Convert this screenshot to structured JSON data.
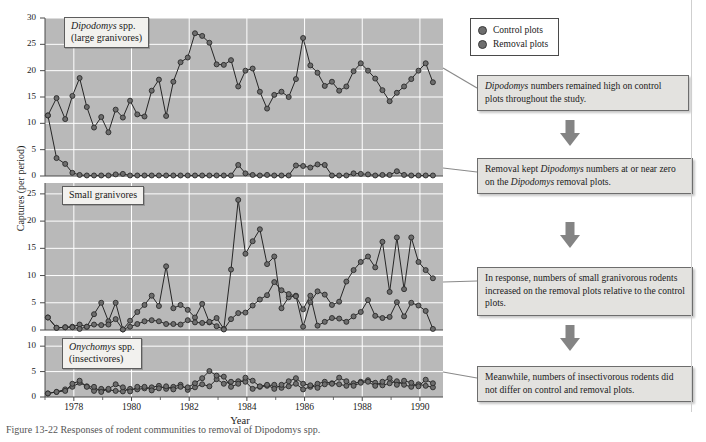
{
  "figure": {
    "caption": "Figure 13-22    Responses of rodent communities to removal of Dipodomys spp.",
    "axis_y_label": "Captures (per period)",
    "axis_x_label": "Year"
  },
  "legend": {
    "items": [
      {
        "label": "Control plots",
        "color": "#6e6e6e",
        "marker": "filled-circle"
      },
      {
        "label": "Removal plots",
        "color": "#6e6e6e",
        "marker": "filled-circle"
      }
    ]
  },
  "callouts": [
    {
      "name": "callout-dipodomys-control",
      "segments": [
        {
          "text": "Dipodomys",
          "italic": true
        },
        {
          "text": " numbers remained high on control plots throughout the study.",
          "italic": false
        }
      ]
    },
    {
      "name": "callout-removal-zero",
      "segments": [
        {
          "text": "Removal kept ",
          "italic": false
        },
        {
          "text": "Dipodomys",
          "italic": true
        },
        {
          "text": " numbers at or near zero on the ",
          "italic": false
        },
        {
          "text": "Dipodomys",
          "italic": true
        },
        {
          "text": " removal plots.",
          "italic": false
        }
      ]
    },
    {
      "name": "callout-small-granivores-increase",
      "segments": [
        {
          "text": "In response, numbers of small granivorous rodents increased on the removal plots relative to the control plots.",
          "italic": false
        }
      ]
    },
    {
      "name": "callout-insectivores-nodiff",
      "segments": [
        {
          "text": "Meanwhile, numbers of insectivorous rodents did not differ on control and removal plots.",
          "italic": false
        }
      ]
    }
  ],
  "chart_data": {
    "type": "line",
    "title": "Responses of rodent communities to removal of Dipodomys spp.",
    "xlabel": "Year",
    "ylabel": "Captures (per period)",
    "xlim": [
      1977.0,
      1990.8
    ],
    "xticks": [
      1978,
      1980,
      1982,
      1984,
      1986,
      1988,
      1990
    ],
    "grid": true,
    "legend_position": "top-right-outside",
    "panels": [
      {
        "name": "dipodomys",
        "label_lines": [
          "Dipodomys spp.",
          "(large granivores)"
        ],
        "label_italic_first_word": true,
        "ylim": [
          0,
          30
        ],
        "yticks": [
          0,
          5,
          10,
          15,
          20,
          25,
          30
        ],
        "x": [
          1977.1,
          1977.4,
          1977.7,
          1977.95,
          1978.2,
          1978.45,
          1978.7,
          1978.95,
          1979.2,
          1979.45,
          1979.7,
          1979.95,
          1980.2,
          1980.45,
          1980.7,
          1980.95,
          1981.2,
          1981.45,
          1981.7,
          1981.95,
          1982.2,
          1982.45,
          1982.7,
          1982.95,
          1983.2,
          1983.45,
          1983.7,
          1983.95,
          1984.2,
          1984.45,
          1984.7,
          1984.95,
          1985.2,
          1985.45,
          1985.7,
          1985.95,
          1986.2,
          1986.45,
          1986.7,
          1986.95,
          1987.2,
          1987.45,
          1987.7,
          1987.95,
          1988.2,
          1988.45,
          1988.7,
          1988.95,
          1989.2,
          1989.45,
          1989.7,
          1989.95,
          1990.2,
          1990.45
        ],
        "series": [
          {
            "name": "Control plots",
            "values": [
              11.5,
              14.8,
              10.8,
              15.2,
              18.6,
              13.1,
              9.2,
              11.2,
              8.3,
              12.6,
              11.1,
              14.3,
              11.7,
              11.3,
              16.2,
              18.3,
              11.4,
              17.9,
              21.6,
              22.5,
              27.1,
              26.6,
              25.3,
              21.2,
              21.1,
              22.0,
              17.0,
              20.0,
              20.4,
              16.0,
              12.8,
              15.4,
              16.0,
              15.0,
              18.4,
              26.2,
              21.0,
              19.6,
              17.1,
              17.9,
              16.2,
              17.0,
              19.9,
              21.4,
              20.0,
              18.5,
              16.3,
              14.2,
              15.8,
              17.0,
              18.4,
              20.0,
              21.4,
              17.8
            ]
          },
          {
            "name": "Removal plots",
            "values": [
              11.5,
              3.4,
              2.3,
              0.6,
              0.2,
              0.1,
              0.1,
              0.1,
              0.1,
              0.3,
              0.4,
              0.1,
              0.1,
              0.1,
              0.1,
              0.1,
              0.1,
              0.1,
              0.1,
              0.1,
              0.1,
              0.1,
              0.1,
              0.1,
              0.1,
              0.1,
              2.1,
              0.5,
              0.2,
              0.1,
              0.2,
              0.1,
              0.1,
              0.1,
              2.0,
              1.9,
              1.6,
              2.2,
              2.1,
              0.1,
              0.1,
              0.1,
              0.5,
              0.4,
              0.3,
              0.1,
              0.2,
              0.2,
              0.9,
              0.2,
              0.1,
              0.1,
              0.1,
              0.1
            ]
          }
        ]
      },
      {
        "name": "small-granivores",
        "label_lines": [
          "Small granivores"
        ],
        "label_italic_first_word": false,
        "ylim": [
          0,
          27
        ],
        "yticks": [
          0,
          5,
          10,
          15,
          20,
          25
        ],
        "x": [
          1977.1,
          1977.4,
          1977.7,
          1977.95,
          1978.2,
          1978.45,
          1978.7,
          1978.95,
          1979.2,
          1979.45,
          1979.7,
          1979.95,
          1980.2,
          1980.45,
          1980.7,
          1980.95,
          1981.2,
          1981.45,
          1981.7,
          1981.95,
          1982.2,
          1982.45,
          1982.7,
          1982.95,
          1983.2,
          1983.45,
          1983.7,
          1983.95,
          1984.2,
          1984.45,
          1984.7,
          1984.95,
          1985.2,
          1985.45,
          1985.7,
          1985.95,
          1986.2,
          1986.45,
          1986.7,
          1986.95,
          1987.2,
          1987.45,
          1987.7,
          1987.95,
          1988.2,
          1988.45,
          1988.7,
          1988.95,
          1989.2,
          1989.45,
          1989.7,
          1989.95,
          1990.2,
          1990.45
        ],
        "series": [
          {
            "name": "Removal plots",
            "values": [
              2.3,
              0.4,
              0.5,
              0.6,
              1.0,
              0.6,
              2.9,
              5.0,
              1.6,
              5.0,
              0.1,
              1.7,
              3.3,
              4.6,
              6.3,
              4.4,
              11.7,
              4.0,
              4.6,
              3.7,
              2.3,
              4.8,
              1.4,
              2.2,
              0.2,
              11.1,
              23.9,
              14.0,
              16.3,
              18.5,
              12.1,
              13.5,
              4.0,
              6.0,
              6.3,
              0.6,
              5.1,
              7.1,
              6.5,
              4.6,
              5.2,
              8.9,
              11.0,
              12.5,
              13.5,
              11.5,
              16.2,
              7.0,
              17.0,
              7.5,
              17.0,
              12.5,
              11.0,
              9.5
            ]
          },
          {
            "name": "Control plots",
            "values": [
              2.3,
              0.4,
              0.5,
              0.5,
              0.2,
              0.6,
              1.0,
              0.9,
              1.0,
              2.0,
              0.1,
              0.6,
              1.1,
              1.6,
              1.8,
              1.6,
              1.1,
              1.1,
              1.0,
              1.8,
              1.4,
              1.3,
              1.5,
              0.7,
              0.1,
              2.0,
              3.1,
              3.2,
              4.5,
              5.6,
              6.4,
              8.8,
              7.3,
              6.6,
              6.2,
              3.8,
              6.3,
              0.8,
              1.5,
              2.2,
              2.1,
              1.5,
              2.5,
              3.3,
              5.5,
              2.6,
              2.2,
              2.4,
              5.1,
              2.5,
              5.0,
              4.5,
              3.5,
              0.2
            ]
          }
        ]
      },
      {
        "name": "onychomys",
        "label_lines": [
          "Onychomys spp.",
          "(insectivores)"
        ],
        "label_italic_first_word": true,
        "ylim": [
          0,
          12
        ],
        "yticks": [
          0,
          5,
          10
        ],
        "x": [
          1977.1,
          1977.4,
          1977.7,
          1977.95,
          1978.2,
          1978.45,
          1978.7,
          1978.95,
          1979.2,
          1979.45,
          1979.7,
          1979.95,
          1980.2,
          1980.45,
          1980.7,
          1980.95,
          1981.2,
          1981.45,
          1981.7,
          1981.95,
          1982.2,
          1982.45,
          1982.7,
          1982.95,
          1983.2,
          1983.45,
          1983.7,
          1983.95,
          1984.2,
          1984.45,
          1984.7,
          1984.95,
          1985.2,
          1985.45,
          1985.7,
          1985.95,
          1986.2,
          1986.45,
          1986.7,
          1986.95,
          1987.2,
          1987.45,
          1987.7,
          1987.95,
          1988.2,
          1988.45,
          1988.7,
          1988.95,
          1989.2,
          1989.45,
          1989.7,
          1989.95,
          1990.2,
          1990.45
        ],
        "series": [
          {
            "name": "Control plots",
            "values": [
              0.7,
              1.0,
              1.5,
              2.0,
              2.8,
              2.1,
              1.2,
              1.6,
              1.4,
              1.2,
              1.1,
              1.6,
              1.5,
              1.7,
              1.9,
              2.2,
              1.6,
              2.0,
              2.4,
              1.4,
              1.9,
              2.5,
              2.1,
              3.5,
              2.6,
              3.0,
              3.1,
              3.0,
              1.6,
              2.0,
              2.2,
              2.4,
              1.8,
              2.1,
              2.6,
              1.5,
              2.0,
              2.6,
              3.0,
              2.7,
              2.5,
              2.2,
              2.7,
              3.0,
              3.3,
              2.8,
              2.3,
              2.7,
              3.1,
              2.4,
              2.0,
              2.5,
              2.2,
              1.9
            ]
          },
          {
            "name": "Removal plots",
            "values": [
              0.7,
              1.0,
              1.2,
              2.6,
              3.2,
              2.0,
              2.0,
              1.0,
              1.6,
              2.5,
              1.9,
              1.1,
              2.0,
              2.0,
              1.3,
              1.7,
              2.1,
              1.5,
              2.0,
              1.9,
              2.7,
              3.7,
              5.1,
              4.2,
              4.0,
              2.0,
              2.6,
              3.8,
              3.2,
              2.1,
              2.4,
              1.6,
              2.4,
              3.1,
              3.7,
              2.6,
              2.3,
              1.8,
              2.5,
              2.6,
              3.8,
              3.1,
              2.2,
              2.8,
              3.0,
              2.2,
              3.0,
              3.7,
              2.4,
              3.2,
              2.8,
              2.1,
              3.4,
              2.7
            ]
          }
        ]
      }
    ]
  },
  "style": {
    "plot_bg": "#b9b9b9",
    "grid_color": "#ffffff",
    "marker_fill": "#6d6d6d",
    "marker_stroke": "#2b2b2b",
    "line_color": "#262626",
    "axis_color": "#4b4b4b"
  }
}
